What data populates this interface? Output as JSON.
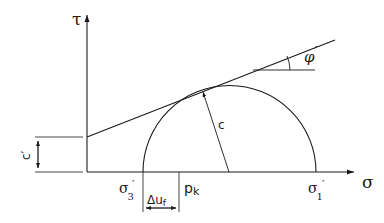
{
  "diagram": {
    "type": "mohr-coulomb-failure-envelope",
    "axes": {
      "y_label": "τ",
      "x_label": "σ"
    },
    "labels": {
      "phi": "φ",
      "phi_prime": "′",
      "cohesion_radius": "c",
      "cohesion_intercept": "c′",
      "sigma3": "σ",
      "sigma3_sub": "3",
      "sigma3_prime": "′",
      "sigma1": "σ",
      "sigma1_sub": "1",
      "sigma1_prime": "′",
      "pk": "p",
      "pk_sub": "k",
      "delta_u": "Δu",
      "delta_u_sub": "f"
    },
    "colors": {
      "stroke": "#1a1a1a",
      "background": "#ffffff"
    }
  }
}
